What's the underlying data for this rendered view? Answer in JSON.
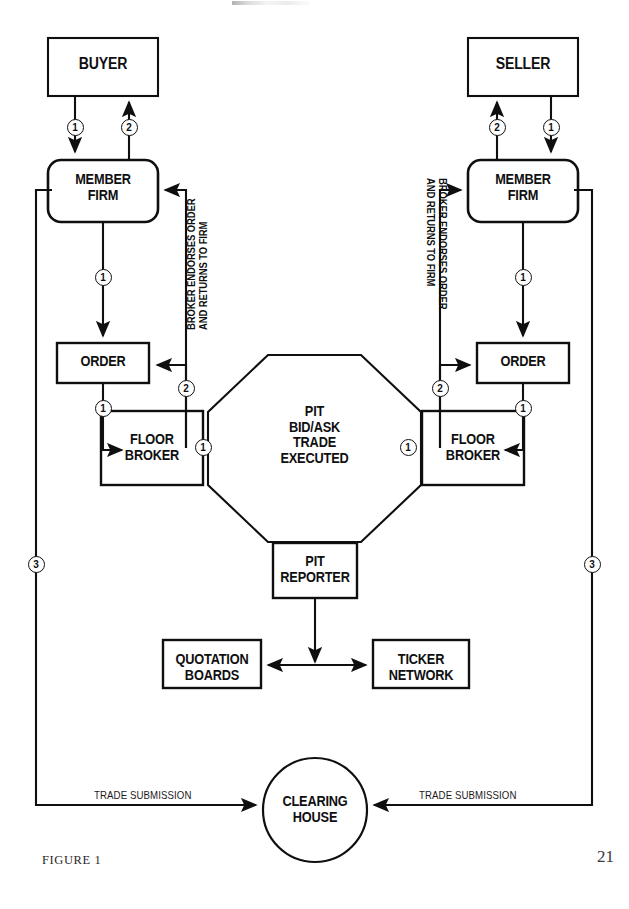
{
  "figure": {
    "caption": "FIGURE 1",
    "page_number": "21",
    "title_fragment": ""
  },
  "nodes": {
    "buyer": "BUYER",
    "seller": "SELLER",
    "member_firm_left": "MEMBER\nFIRM",
    "member_firm_right": "MEMBER\nFIRM",
    "order_left": "ORDER",
    "order_right": "ORDER",
    "floor_broker_left": "FLOOR\nBROKER",
    "floor_broker_right": "FLOOR\nBROKER",
    "pit": "PIT\nBID/ASK\nTRADE\nEXECUTED",
    "pit_reporter": "PIT\nREPORTER",
    "quotation_boards": "QUOTATION\nBOARDS",
    "ticker_network": "TICKER\nNETWORK",
    "clearing_house": "CLEARING\nHOUSE"
  },
  "annotations": {
    "broker_endorses_left": "BROKER ENDORSES ORDER\nAND RETURNS TO FIRM",
    "broker_endorses_right": "BROKER ENDORSES ORDER\nAND RETURNS TO FIRM",
    "trade_submission_left": "TRADE SUBMISSION",
    "trade_submission_right": "TRADE SUBMISSION"
  },
  "steps": {
    "buyer_to_firm": "1",
    "firm_to_buyer": "2",
    "seller_to_firm": "1",
    "firm_to_seller": "2",
    "firm_to_order_left": "1",
    "firm_to_order_right": "1",
    "order_to_broker_left": "1",
    "order_to_broker_right": "1",
    "broker_to_pit_left": "1",
    "broker_to_pit_right": "1",
    "endorse_left": "2",
    "endorse_right": "2",
    "clearing_left": "3",
    "clearing_right": "3"
  },
  "colors": {
    "ink": "#100f10",
    "paper": "#ffffff"
  }
}
